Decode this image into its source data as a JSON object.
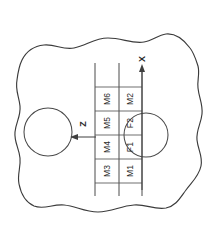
{
  "figure": {
    "background_color": "#ffffff",
    "line_color": "#3b3b3b"
  },
  "axes": [
    {
      "name": "x-axis",
      "label": "X",
      "direction": "up",
      "label_x": 142,
      "label_y": 60,
      "line_x": 142,
      "line_y1": 70,
      "line_y2": 190,
      "arrow_y": 68
    },
    {
      "name": "z-axis",
      "label": "Z",
      "direction": "left",
      "label_x": 83,
      "label_y": 124,
      "line_y": 137,
      "line_x1": 74,
      "line_x2": 96,
      "arrow_x": 73
    }
  ],
  "grid": {
    "column_upper_label": "M-row",
    "column_lower_label": "F-row",
    "x_left": 95,
    "x_mid": 119,
    "x_right": 142,
    "y_top": 87,
    "y_bottom": 183,
    "row_dividers": [
      111,
      135,
      159
    ],
    "vertical_extent_top": 63,
    "vertical_extent_bottom": 196
  },
  "cells": [
    {
      "name": "cell-m6",
      "label": "M6",
      "column": "upper",
      "cx": 107,
      "cy": 99
    },
    {
      "name": "cell-m5",
      "label": "M5",
      "column": "upper",
      "cx": 107,
      "cy": 123
    },
    {
      "name": "cell-m4",
      "label": "M4",
      "column": "upper",
      "cx": 107,
      "cy": 147
    },
    {
      "name": "cell-m3",
      "label": "M3",
      "column": "upper",
      "cx": 107,
      "cy": 171
    },
    {
      "name": "cell-m2",
      "label": "M2",
      "column": "lower",
      "cx": 130,
      "cy": 99
    },
    {
      "name": "cell-f2",
      "label": "F2",
      "column": "lower",
      "cx": 130,
      "cy": 123
    },
    {
      "name": "cell-f1",
      "label": "F1",
      "column": "lower",
      "cx": 130,
      "cy": 147
    },
    {
      "name": "cell-m1",
      "label": "M1",
      "column": "lower",
      "cx": 130,
      "cy": 171
    }
  ],
  "holes": [
    {
      "name": "hole-left",
      "cx": 48,
      "cy": 132,
      "r": 24
    },
    {
      "name": "hole-right",
      "cx": 146,
      "cy": 135,
      "r": 22
    }
  ],
  "outline": {
    "name": "plate-outline",
    "path": "M 22,60 C 26,52 34,46 44,45 C 56,44 62,50 74,48 C 86,46 94,38 108,38 C 122,38 132,44 144,42 C 152,41 158,35 166,34 C 176,33 184,40 190,48 C 194,53 196,60 198,66 C 200,74 197,80 198,88 C 199,98 203,104 202,114 C 201,124 196,130 197,140 C 198,150 203,156 201,166 C 199,176 192,182 186,190 C 180,198 176,206 166,208 C 154,210 146,204 134,205 C 120,206 112,212 98,212 C 84,212 76,206 64,205 C 52,204 44,210 34,206 C 25,202 21,194 19,184 C 17,174 21,168 20,158 C 19,148 14,142 15,132 C 16,122 21,116 20,106 C 19,96 15,90 17,80 C 18,72 19,66 22,60 Z"
  }
}
